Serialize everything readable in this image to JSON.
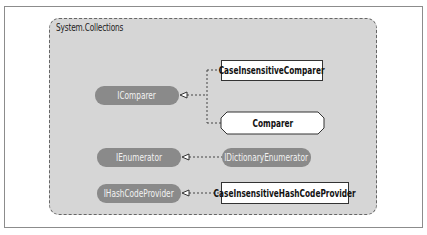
{
  "diagram": {
    "namespace": "System.Collections",
    "interfaces": [
      {
        "id": "icomparer",
        "label": "IComparer"
      },
      {
        "id": "ienumerator",
        "label": "IEnumerator"
      },
      {
        "id": "idictionaryenumerator",
        "label": "IDictionaryEnumerator"
      },
      {
        "id": "ihashcodeprovider",
        "label": "IHashCodeProvider"
      }
    ],
    "classes": [
      {
        "id": "caseinsensitivecomparer",
        "label": "CaseInsensitiveComparer"
      },
      {
        "id": "comparer",
        "label": "Comparer"
      },
      {
        "id": "caseinsensitivehashcodeprovider",
        "label": "CaseInsensitiveHashCodeProvider"
      }
    ],
    "relations": [
      {
        "from": "CaseInsensitiveComparer",
        "to": "IComparer",
        "type": "implements"
      },
      {
        "from": "Comparer",
        "to": "IComparer",
        "type": "implements"
      },
      {
        "from": "IDictionaryEnumerator",
        "to": "IEnumerator",
        "type": "extends"
      },
      {
        "from": "CaseInsensitiveHashCodeProvider",
        "to": "IHashCodeProvider",
        "type": "implements"
      }
    ],
    "colors": {
      "namespace_fill": "#d6d6d6",
      "interface_fill": "#8a8a8a",
      "class_fill": "#ffffff"
    }
  }
}
